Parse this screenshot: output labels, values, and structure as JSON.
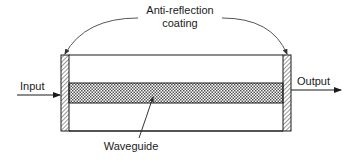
{
  "diagram": {
    "title_label_line1": "Anti-reflection",
    "title_label_line2": "coating",
    "input_label": "Input",
    "output_label": "Output",
    "waveguide_label": "Waveguide",
    "colors": {
      "stroke": "#1a1a1a",
      "background": "#ffffff",
      "arc": "#555555"
    },
    "components": [
      {
        "name": "left-anti-reflection-coating",
        "pattern": "diagonal-hatch"
      },
      {
        "name": "right-anti-reflection-coating",
        "pattern": "diagonal-hatch"
      },
      {
        "name": "waveguide-core",
        "pattern": "crosshatch"
      },
      {
        "name": "substrate-box",
        "pattern": "none"
      }
    ],
    "arrows": [
      {
        "from": "Input",
        "to": "left-anti-reflection-coating"
      },
      {
        "from": "right-anti-reflection-coating",
        "to": "Output"
      },
      {
        "from": "Anti-reflection coating",
        "to": "left-anti-reflection-coating"
      },
      {
        "from": "Anti-reflection coating",
        "to": "right-anti-reflection-coating"
      },
      {
        "from": "Waveguide",
        "to": "waveguide-core"
      }
    ]
  }
}
